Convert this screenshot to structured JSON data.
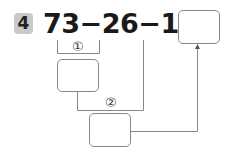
{
  "problem": {
    "number": "4",
    "expression": "73−26−18=",
    "step_labels": [
      "①",
      "②"
    ],
    "answer_boxes": [
      "",
      "",
      ""
    ]
  },
  "colors": {
    "badge_bg": "#c9c9c9",
    "lines": "#888888",
    "text": "#1a1a1a"
  }
}
